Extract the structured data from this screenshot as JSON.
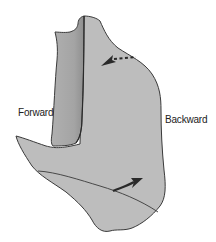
{
  "labels": {
    "forward": "Forward",
    "backward": "Backward"
  },
  "arrows": [
    {
      "name": "dotted-arrow",
      "style": "dotted",
      "direction": "toward-left"
    },
    {
      "name": "solid-curved-arrow",
      "style": "solid",
      "direction": "toward-right"
    }
  ],
  "colors": {
    "fill": "#bdbdbd",
    "fill_dark": "#9a9a9a",
    "outline": "#3a3a3a",
    "arrow": "#2a2a2a",
    "text": "#222222"
  }
}
